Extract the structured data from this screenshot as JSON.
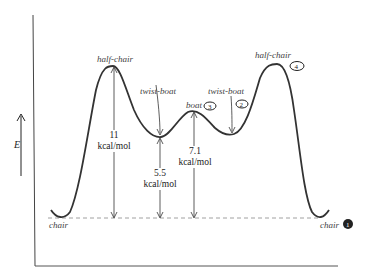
{
  "diagram": {
    "axis": {
      "y_label": "E"
    },
    "states": [
      {
        "id": "chair-left",
        "label": "chair"
      },
      {
        "id": "half-chair-left",
        "label": "half-chair"
      },
      {
        "id": "twist-boat-left",
        "label": "twist-boat"
      },
      {
        "id": "boat",
        "label": "boat",
        "annotation": "3"
      },
      {
        "id": "twist-boat-right",
        "label": "twist-boat",
        "annotation": "2"
      },
      {
        "id": "half-chair-right",
        "label": "half-chair",
        "annotation": "4"
      },
      {
        "id": "chair-right",
        "label": "chair",
        "annotation": "1"
      }
    ],
    "energies": [
      {
        "value": "11",
        "unit": "kcal/mol",
        "to": "half-chair"
      },
      {
        "value": "5.5",
        "unit": "kcal/mol",
        "to": "twist-boat"
      },
      {
        "value": "7.1",
        "unit": "kcal/mol",
        "to": "boat"
      }
    ]
  }
}
